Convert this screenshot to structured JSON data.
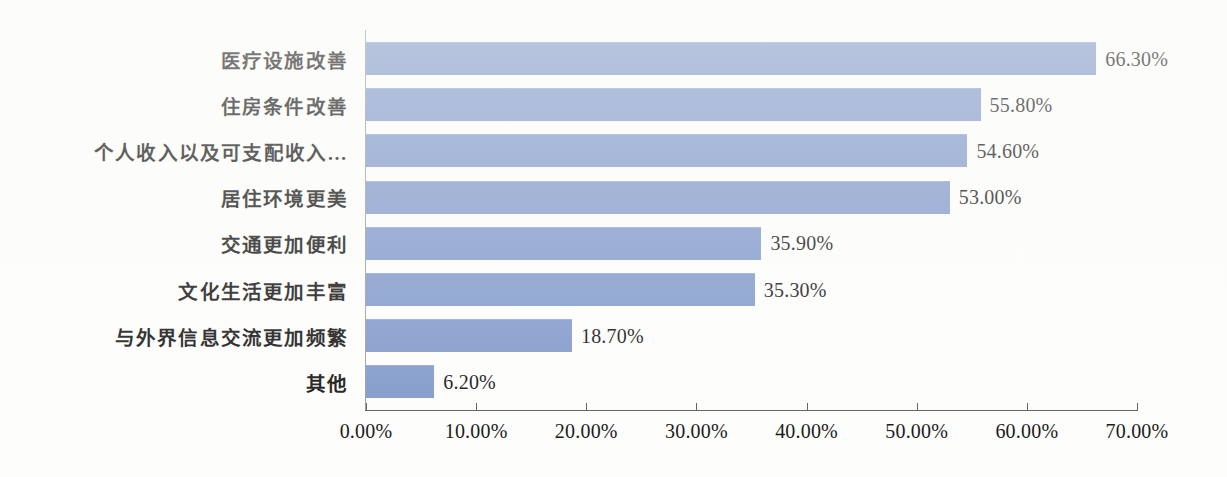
{
  "chart_data": {
    "type": "bar",
    "orientation": "horizontal",
    "title": "",
    "subtitle": "",
    "xlabel": "",
    "ylabel": "",
    "grid": false,
    "legend": false,
    "legend_position": "none",
    "xlim": [
      0,
      70
    ],
    "x_tick_labels": [
      "0.00%",
      "10.00%",
      "20.00%",
      "30.00%",
      "40.00%",
      "50.00%",
      "60.00%",
      "70.00%"
    ],
    "x_ticks": [
      0,
      10,
      20,
      30,
      40,
      50,
      60,
      70
    ],
    "categories": [
      "医疗设施改善",
      "住房条件改善",
      "个人收入以及可支配收入…",
      "居住环境更美",
      "交通更加便利",
      "文化生活更加丰富",
      "与外界信息交流更加频繁",
      "其他"
    ],
    "values": [
      66.3,
      55.8,
      54.6,
      53.0,
      35.9,
      35.3,
      18.7,
      6.2
    ],
    "value_labels": [
      "66.30%",
      "55.80%",
      "54.60%",
      "53.00%",
      "35.90%",
      "35.30%",
      "18.70%",
      "6.20%"
    ],
    "bar_color": "#7e97ca",
    "axis_color": "#585858",
    "text_color": "#101010",
    "background_color": "#fdfdfc"
  }
}
